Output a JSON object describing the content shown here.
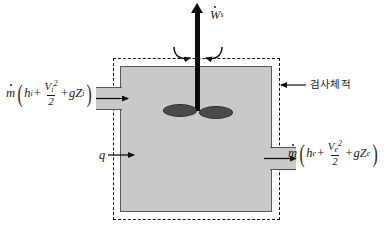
{
  "figure": {
    "colors": {
      "fill": "#c9c9c9",
      "vessel_border": "#555555",
      "boundary": "#111111",
      "shaft": "#0a0a0a",
      "blade": "#4a4a4a"
    }
  },
  "labels": {
    "shaft_work": {
      "symbol": "W",
      "subscript": "s",
      "name": "shaft-work"
    },
    "heat": {
      "symbol": "q",
      "name": "heat-transfer"
    },
    "control_volume": {
      "text": "검사체적",
      "name": "control-volume"
    },
    "inlet": {
      "mass_flow": "m",
      "enthalpy": "h",
      "enthalpy_sub": "i",
      "velocity": "V",
      "velocity_sub": "i",
      "velocity_exp": "2",
      "denominator": "2",
      "gravity": "g",
      "elevation": "Z",
      "elevation_sub": "i",
      "plus1": "+",
      "plus2": "+",
      "open_paren": "(",
      "close_paren": ")"
    },
    "outlet": {
      "mass_flow": "m",
      "enthalpy": "h",
      "enthalpy_sub": "e",
      "velocity": "V",
      "velocity_sub": "e",
      "velocity_exp": "2",
      "denominator": "2",
      "gravity": "g",
      "elevation": "Z",
      "elevation_sub": "e",
      "plus1": "+",
      "plus2": "+",
      "open_paren": "(",
      "close_paren": ")"
    }
  }
}
